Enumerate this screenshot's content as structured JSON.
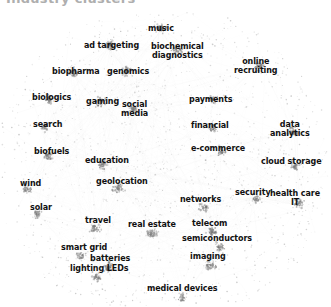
{
  "figure": {
    "title_cropped": "Industry clusters",
    "type": "network-graph",
    "background_color": "#ffffff",
    "node_color": "#7a7a7a",
    "edge_color": "#cfcfcf",
    "label_color": "#111111"
  },
  "chart_data": {
    "type": "scatter",
    "title": "",
    "xlabel": "",
    "ylabel": "",
    "grid": false,
    "legend": "none",
    "nodes": [
      {
        "label": "music",
        "x": 161,
        "y": 29,
        "align": "center",
        "lines": [
          "music"
        ]
      },
      {
        "label": "ad targeting",
        "x": 112,
        "y": 46,
        "align": "center",
        "lines": [
          "ad targeting"
        ]
      },
      {
        "label": "biochemical diagnostics",
        "x": 177,
        "y": 51,
        "align": "center",
        "lines": [
          "biochemical",
          "diagnostics"
        ]
      },
      {
        "label": "biopharma",
        "x": 76,
        "y": 72,
        "align": "center",
        "lines": [
          "biopharma"
        ]
      },
      {
        "label": "genomics",
        "x": 128,
        "y": 72,
        "align": "center",
        "lines": [
          "genomics"
        ]
      },
      {
        "label": "online recruiting",
        "x": 256,
        "y": 66,
        "align": "center",
        "lines": [
          "online",
          "recruiting"
        ]
      },
      {
        "label": "biologics",
        "x": 52,
        "y": 98,
        "align": "center",
        "lines": [
          "biologics"
        ]
      },
      {
        "label": "gaming",
        "x": 103,
        "y": 102,
        "align": "center",
        "lines": [
          "gaming"
        ]
      },
      {
        "label": "social media",
        "x": 135,
        "y": 109,
        "align": "center",
        "lines": [
          "social",
          "media"
        ]
      },
      {
        "label": "payments",
        "x": 211,
        "y": 100,
        "align": "center",
        "lines": [
          "payments"
        ]
      },
      {
        "label": "data analytics",
        "x": 290,
        "y": 129,
        "align": "center",
        "lines": [
          "data",
          "analytics"
        ]
      },
      {
        "label": "search",
        "x": 48,
        "y": 125,
        "align": "center",
        "lines": [
          "search"
        ]
      },
      {
        "label": "financial",
        "x": 210,
        "y": 126,
        "align": "center",
        "lines": [
          "financial"
        ]
      },
      {
        "label": "biofuels",
        "x": 52,
        "y": 152,
        "align": "center",
        "lines": [
          "biofuels"
        ]
      },
      {
        "label": "e-commerce",
        "x": 218,
        "y": 149,
        "align": "center",
        "lines": [
          "e-commerce"
        ]
      },
      {
        "label": "cloud storage",
        "x": 291,
        "y": 162,
        "align": "center",
        "lines": [
          "cloud storage"
        ]
      },
      {
        "label": "education",
        "x": 107,
        "y": 161,
        "align": "center",
        "lines": [
          "education"
        ]
      },
      {
        "label": "wind",
        "x": 31,
        "y": 184,
        "align": "center",
        "lines": [
          "wind"
        ]
      },
      {
        "label": "geolocation",
        "x": 122,
        "y": 182,
        "align": "center",
        "lines": [
          "geolocation"
        ]
      },
      {
        "label": "networks",
        "x": 201,
        "y": 200,
        "align": "center",
        "lines": [
          "networks"
        ]
      },
      {
        "label": "security",
        "x": 253,
        "y": 193,
        "align": "center",
        "lines": [
          "security"
        ]
      },
      {
        "label": "health care IT",
        "x": 295,
        "y": 198,
        "align": "center",
        "lines": [
          "health care",
          "IT"
        ]
      },
      {
        "label": "solar",
        "x": 41,
        "y": 208,
        "align": "center",
        "lines": [
          "solar"
        ]
      },
      {
        "label": "travel",
        "x": 98,
        "y": 221,
        "align": "center",
        "lines": [
          "travel"
        ]
      },
      {
        "label": "real estate",
        "x": 152,
        "y": 225,
        "align": "center",
        "lines": [
          "real estate"
        ]
      },
      {
        "label": "telecom",
        "x": 210,
        "y": 224,
        "align": "center",
        "lines": [
          "telecom"
        ]
      },
      {
        "label": "semiconductors",
        "x": 217,
        "y": 239,
        "align": "center",
        "lines": [
          "semiconductors"
        ]
      },
      {
        "label": "smart grid",
        "x": 84,
        "y": 248,
        "align": "center",
        "lines": [
          "smart grid"
        ]
      },
      {
        "label": "batteries",
        "x": 110,
        "y": 259,
        "align": "center",
        "lines": [
          "batteries"
        ]
      },
      {
        "label": "lighting LEDs",
        "x": 99,
        "y": 269,
        "align": "center",
        "lines": [
          "lighting LEDs"
        ]
      },
      {
        "label": "imaging",
        "x": 208,
        "y": 257,
        "align": "center",
        "lines": [
          "imaging"
        ]
      },
      {
        "label": "medical devices",
        "x": 182,
        "y": 289,
        "align": "center",
        "lines": [
          "medical devices"
        ]
      }
    ]
  }
}
